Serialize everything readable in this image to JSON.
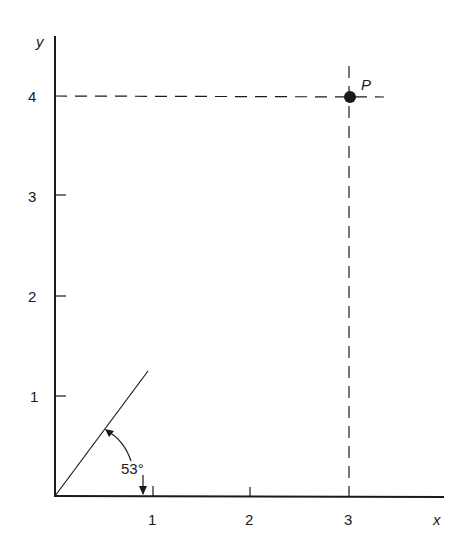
{
  "figure": {
    "axes": {
      "x_label": "x",
      "y_label": "y",
      "x_ticks": [
        "1",
        "2",
        "3"
      ],
      "y_ticks": [
        "1",
        "2",
        "3",
        "4"
      ]
    },
    "point": {
      "label": "P",
      "x": 3,
      "y": 4
    },
    "angle": {
      "label": "53°",
      "degrees": 53
    },
    "colors": {
      "ink": "#1a1a1a",
      "background": "#ffffff"
    }
  }
}
